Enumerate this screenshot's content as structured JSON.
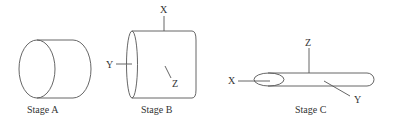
{
  "figure": {
    "stroke_color": "#555555",
    "text_color": "#333333",
    "stages": [
      {
        "id": "A",
        "caption": "Stage A",
        "shape": "short-wide-cylinder",
        "axes": []
      },
      {
        "id": "B",
        "caption": "Stage B",
        "shape": "tall-cylinder",
        "axes": [
          {
            "label": "X",
            "direction": "up"
          },
          {
            "label": "Y",
            "direction": "left"
          },
          {
            "label": "Z",
            "direction": "into-page"
          }
        ]
      },
      {
        "id": "C",
        "caption": "Stage C",
        "shape": "long-thin-tube",
        "axes": [
          {
            "label": "X",
            "direction": "left"
          },
          {
            "label": "Z",
            "direction": "up"
          },
          {
            "label": "Y",
            "direction": "diagonal-down-right"
          }
        ]
      }
    ]
  }
}
